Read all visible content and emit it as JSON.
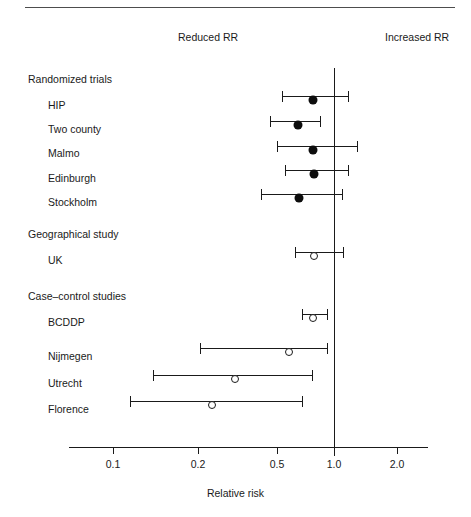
{
  "figure": {
    "axis_title": "Relative risk",
    "header_left": "Reduced RR",
    "header_right": "Increased RR"
  },
  "chart_data": {
    "type": "scatter",
    "title": "",
    "xlabel": "Relative risk",
    "ylabel": "",
    "xscale": "log",
    "xlim": [
      0.08,
      2.4
    ],
    "grid": false,
    "legend": "none",
    "reference_line": 1.0,
    "annotations": [
      "Reduced RR",
      "Increased RR"
    ],
    "tick_labels": [
      "0.1",
      "0.2",
      "0.5",
      "1.0",
      "2.0"
    ],
    "tick_values": [
      0.1,
      0.2,
      0.5,
      1.0,
      2.0
    ],
    "tick_px": [
      113,
      198,
      277,
      334,
      397
    ],
    "groups": [
      {
        "name": "Randomized trials",
        "label_px_y": 73,
        "marker": "filled",
        "rows": [
          {
            "label": "HIP",
            "label_px_y": 99,
            "row_px_y": 96,
            "estimate": 0.78,
            "low": 0.59,
            "high": 1.06,
            "px": {
              "point": 313,
              "low": 282,
              "high": 348
            }
          },
          {
            "label": "Two county",
            "label_px_y": 123,
            "row_px_y": 121,
            "estimate": 0.68,
            "low": 0.52,
            "high": 0.88,
            "px": {
              "point": 298,
              "low": 270,
              "high": 320
            }
          },
          {
            "label": "Malmo",
            "label_px_y": 147,
            "row_px_y": 146,
            "estimate": 0.78,
            "low": 0.56,
            "high": 1.21,
            "px": {
              "point": 313,
              "low": 277,
              "high": 357
            }
          },
          {
            "label": "Edinburgh",
            "label_px_y": 172,
            "row_px_y": 170,
            "estimate": 0.8,
            "low": 0.6,
            "high": 1.06,
            "px": {
              "point": 314,
              "low": 285,
              "high": 348
            }
          },
          {
            "label": "Stockholm",
            "label_px_y": 196,
            "row_px_y": 194,
            "estimate": 0.69,
            "low": 0.47,
            "high": 1.04,
            "px": {
              "point": 299,
              "low": 261,
              "high": 342
            }
          }
        ]
      },
      {
        "name": "Geographical study",
        "label_px_y": 228,
        "marker": "open",
        "rows": [
          {
            "label": "UK",
            "label_px_y": 254,
            "row_px_y": 252,
            "estimate": 0.8,
            "low": 0.66,
            "high": 0.99,
            "px": {
              "point": 314,
              "low": 295,
              "high": 343
            }
          }
        ]
      },
      {
        "name": "Case–control studies",
        "label_px_y": 290,
        "marker": "open",
        "rows": [
          {
            "label": "BCDDP",
            "label_px_y": 316,
            "row_px_y": 314,
            "estimate": 0.78,
            "low": 0.7,
            "high": 0.88,
            "px": {
              "point": 313,
              "low": 302,
              "high": 327
            }
          },
          {
            "label": "Nijmegen",
            "label_px_y": 350,
            "row_px_y": 348,
            "estimate": 0.55,
            "low": 0.2,
            "high": 0.88,
            "px": {
              "point": 289,
              "low": 200,
              "high": 327
            }
          },
          {
            "label": "Utrecht",
            "label_px_y": 377,
            "row_px_y": 375,
            "estimate": 0.3,
            "low": 0.14,
            "high": 0.75,
            "px": {
              "point": 235,
              "low": 153,
              "high": 312
            }
          },
          {
            "label": "Florence",
            "label_px_y": 403,
            "row_px_y": 401,
            "estimate": 0.21,
            "low": 0.11,
            "high": 0.65,
            "px": {
              "point": 212,
              "low": 130,
              "high": 302
            }
          }
        ]
      }
    ]
  }
}
